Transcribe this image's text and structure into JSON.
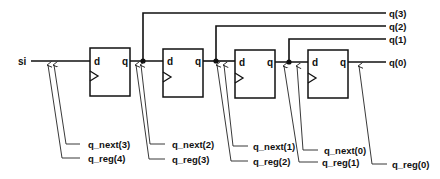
{
  "diagram": {
    "type": "shift-register-schematic",
    "input": {
      "label": "si"
    },
    "flip_flops": [
      {
        "id": "ff3",
        "d_label": "d",
        "q_label": "q"
      },
      {
        "id": "ff2",
        "d_label": "d",
        "q_label": "q"
      },
      {
        "id": "ff1",
        "d_label": "d",
        "q_label": "q"
      },
      {
        "id": "ff0",
        "d_label": "d",
        "q_label": "q"
      }
    ],
    "outputs": [
      {
        "label": "q(3)"
      },
      {
        "label": "q(2)"
      },
      {
        "label": "q(1)"
      },
      {
        "label": "q(0)"
      }
    ],
    "signal_annotations": [
      {
        "label": "q_next(3)"
      },
      {
        "label": "q_reg(4)"
      },
      {
        "label": "q_next(2)"
      },
      {
        "label": "q_reg(3)"
      },
      {
        "label": "q_next(1)"
      },
      {
        "label": "q_reg(2)"
      },
      {
        "label": "q_next(0)"
      },
      {
        "label": "q_reg(1)"
      },
      {
        "label": "q_reg(0)"
      }
    ]
  }
}
